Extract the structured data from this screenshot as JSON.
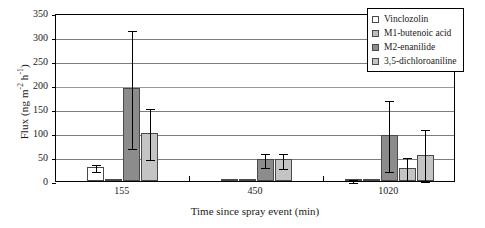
{
  "chart_data": {
    "type": "bar",
    "title": "",
    "xlabel": "Time since spray event (min)",
    "ylabel": "Flux (ng m⁻² h⁻¹)",
    "ylabel_parts": {
      "prefix": "Flux (ng m",
      "sup1": "-2",
      "mid": " h",
      "sup2": "-1",
      "suffix": ")"
    },
    "categories": [
      "155",
      "450",
      "1020"
    ],
    "ylim": [
      0,
      350
    ],
    "yticks": [
      0,
      50,
      100,
      150,
      200,
      250,
      300,
      350
    ],
    "grid": true,
    "grid_axis": "y",
    "legend_position": "top-right",
    "error_bars": true,
    "series": [
      {
        "name": "Vinclozolin",
        "color": "#ffffff",
        "values": [
          30,
          3,
          3
        ],
        "err_low": [
          22,
          3,
          1
        ],
        "err_high": [
          38,
          3,
          6
        ]
      },
      {
        "name": "M1-butenoic acid",
        "color": "#bfbfbf",
        "values": [
          0,
          0,
          0
        ],
        "err_low": [
          0,
          0,
          0
        ],
        "err_high": [
          0,
          0,
          0
        ]
      },
      {
        "name": "M2-enanilide",
        "color": "#8c8c8c",
        "values": [
          193,
          45,
          95
        ],
        "err_low": [
          70,
          32,
          23
        ],
        "err_high": [
          317,
          60,
          170
        ]
      },
      {
        "name": "3,5-dichloroaniline",
        "color": "#c4c4c4",
        "values": [
          100,
          45,
          27
        ],
        "err_low": [
          47,
          30,
          5
        ],
        "err_high": [
          155,
          60,
          52
        ]
      },
      {
        "name": "3,5-dichloroaniline-extra",
        "color": "#c4c4c4",
        "values": [
          null,
          null,
          55
        ],
        "err_low": [
          null,
          null,
          3
        ],
        "err_high": [
          null,
          null,
          110
        ]
      }
    ]
  },
  "legend": {
    "items": [
      {
        "label": "Vinclozolin",
        "color": "#ffffff"
      },
      {
        "label": "M1-butenoic acid",
        "color": "#bfbfbf"
      },
      {
        "label": "M2-enanilide",
        "color": "#8c8c8c"
      },
      {
        "label": "3,5-dichloroaniline",
        "color": "#c4c4c4"
      }
    ]
  }
}
